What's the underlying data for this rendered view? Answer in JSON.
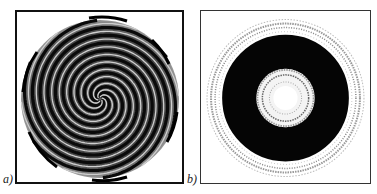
{
  "figure": {
    "panels": [
      {
        "id": "a",
        "label": "a)",
        "description": "spiral wave pattern, multi-armed spiral in circular domain"
      },
      {
        "id": "b",
        "label": "b)",
        "description": "concentric ring pattern with dark annulus and bright center"
      }
    ]
  }
}
